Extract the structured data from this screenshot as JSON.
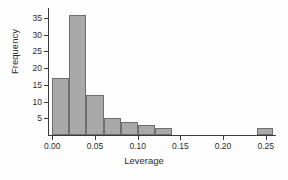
{
  "chart_data": {
    "type": "bar",
    "title": "",
    "xlabel": "Leverage",
    "ylabel": "Frequency",
    "xlim": [
      -0.005,
      0.262
    ],
    "ylim": [
      0,
      38
    ],
    "grid": false,
    "legend": "none",
    "bin_width": 0.02,
    "categories": [
      "0.00-0.02",
      "0.02-0.04",
      "0.04-0.06",
      "0.06-0.08",
      "0.08-0.10",
      "0.10-0.12",
      "0.12-0.14",
      "0.24-0.26"
    ],
    "bins": [
      {
        "left": 0.0,
        "right": 0.02,
        "value": 17
      },
      {
        "left": 0.02,
        "right": 0.04,
        "value": 36
      },
      {
        "left": 0.04,
        "right": 0.06,
        "value": 12
      },
      {
        "left": 0.06,
        "right": 0.08,
        "value": 5
      },
      {
        "left": 0.08,
        "right": 0.1,
        "value": 4
      },
      {
        "left": 0.1,
        "right": 0.12,
        "value": 3
      },
      {
        "left": 0.12,
        "right": 0.14,
        "value": 2
      },
      {
        "left": 0.24,
        "right": 0.258,
        "value": 2
      }
    ],
    "values": [
      17,
      36,
      12,
      5,
      4,
      3,
      2,
      2
    ],
    "xticks": [
      0.0,
      0.05,
      0.1,
      0.15,
      0.2,
      0.25
    ],
    "xtick_labels": [
      "0.00",
      "0.05",
      "0.10",
      "0.15",
      "0.20",
      "0.25"
    ],
    "yticks": [
      5,
      10,
      15,
      20,
      25,
      30,
      35
    ],
    "ytick_labels": [
      "5",
      "10",
      "15",
      "20",
      "25",
      "30",
      "35"
    ],
    "colors": {
      "bar_fill": "#a9a9a9",
      "bar_edge": "#6e6e6e",
      "axis": "#3a3a3a",
      "text": "#2b2b2b",
      "background": "#fefefe"
    }
  }
}
